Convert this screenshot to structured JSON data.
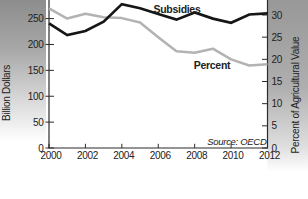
{
  "figure": {
    "left_axis_title": "Billion Dollars",
    "right_axis_title": "Percent of Agricultural Value",
    "subsidies_label": "Subsidies",
    "percent_label": "Percent",
    "source_note": "Source: OECD"
  },
  "colors": {
    "subsidies_line": "#161616",
    "percent_line": "#b3b3b3",
    "axis": "#2b2b2b",
    "text": "#222222",
    "page_shadow_left_top": "#8d8d8d",
    "page_shadow_right_top": "#989898",
    "background": "#ffffff"
  },
  "chart_data": {
    "type": "line",
    "title": "",
    "xlabel": "",
    "ylabel_left": "Billion Dollars",
    "ylabel_right": "Percent of Agricultural Value",
    "source": "Source: OECD",
    "legend_position": "direct-line-labels",
    "grid": false,
    "x": [
      2000,
      2001,
      2002,
      2003,
      2004,
      2005,
      2006,
      2007,
      2008,
      2009,
      2010,
      2011,
      2012
    ],
    "x_tick_labels": [
      "2000",
      "2002",
      "2004",
      "2006",
      "2008",
      "2010",
      "2012"
    ],
    "x_ticks": [
      2000,
      2002,
      2004,
      2006,
      2008,
      2010,
      2012
    ],
    "y_left_ticks": [
      0,
      50,
      100,
      150,
      200,
      250
    ],
    "y_right_ticks": [
      0,
      5,
      10,
      15,
      20,
      25,
      30
    ],
    "y_left_visible_range": [
      0,
      286
    ],
    "y_right_visible_range": [
      0,
      33.4
    ],
    "note": "top of plot is cropped by the page edge; no top frame line visible",
    "series": [
      {
        "name": "Subsidies",
        "axis": "left",
        "units": "billion dollars",
        "values": [
          241,
          218,
          226,
          244,
          278,
          270,
          259,
          248,
          262,
          250,
          242,
          258,
          260
        ]
      },
      {
        "name": "Percent",
        "axis": "right",
        "units": "percent of agricultural value",
        "values": [
          31.5,
          29.2,
          30.3,
          29.5,
          29.3,
          28.3,
          25.0,
          21.8,
          21.5,
          22.4,
          20.0,
          18.6,
          18.9
        ]
      }
    ]
  }
}
